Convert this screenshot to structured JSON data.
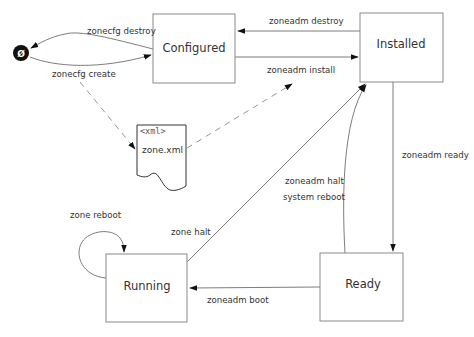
{
  "diagram": {
    "null_state": {
      "symbol": "Ø"
    },
    "states": {
      "configured": "Configured",
      "installed": "Installed",
      "ready": "Ready",
      "running": "Running"
    },
    "document": {
      "tag": "<xml>",
      "name": "zone.xml"
    },
    "transitions": {
      "zonecfg_destroy": "zonecfg destroy",
      "zonecfg_create": "zonecfg create",
      "zoneadm_destroy": "zoneadm destroy",
      "zoneadm_install": "zoneadm install",
      "zoneadm_ready": "zoneadm ready",
      "zoneadm_halt": "zoneadm halt",
      "system_reboot": "system reboot",
      "zone_halt": "zone halt",
      "zone_reboot": "zone reboot",
      "zoneadm_boot": "zoneadm boot"
    },
    "colors": {
      "line": "#6e6e6e",
      "box_border": "#8a8a8a",
      "text": "#333333",
      "null_fill": "#111111"
    }
  }
}
